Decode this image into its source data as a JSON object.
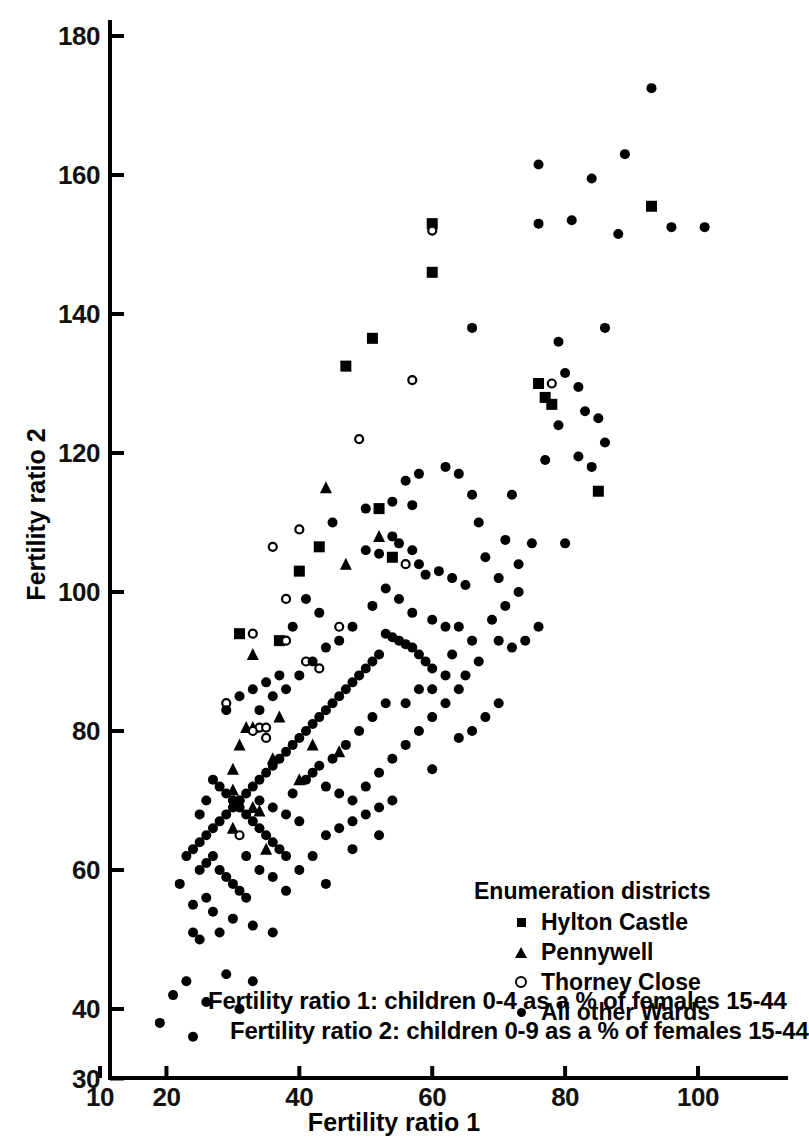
{
  "chart_data": {
    "type": "scatter",
    "title": "",
    "xlabel": "Fertility ratio 1",
    "ylabel": "Fertility ratio 2",
    "xlim": [
      10,
      108
    ],
    "ylim": [
      30,
      182
    ],
    "xticks": [
      10,
      20,
      40,
      60,
      80,
      100
    ],
    "yticks": [
      30,
      40,
      60,
      80,
      100,
      120,
      140,
      160,
      180
    ],
    "xtick_labels": [
      "10",
      "20",
      "40",
      "60",
      "80",
      "100"
    ],
    "ytick_labels": [
      "30",
      "40",
      "60",
      "80",
      "100",
      "120",
      "140",
      "160",
      "180"
    ],
    "grid": false,
    "legend_position": "lower-right",
    "legend_title": "Enumeration districts",
    "series": [
      {
        "name": "Hylton Castle",
        "marker": "filled-square",
        "points": [
          [
            47,
            132.5
          ],
          [
            60,
            153
          ],
          [
            60,
            146
          ],
          [
            51,
            136.5
          ],
          [
            43,
            106.5
          ],
          [
            40,
            103
          ],
          [
            52,
            112
          ],
          [
            37,
            93
          ],
          [
            76,
            130
          ],
          [
            77,
            128
          ],
          [
            85,
            114.5
          ],
          [
            93,
            155.5
          ],
          [
            78,
            127
          ],
          [
            54,
            105
          ],
          [
            31,
            94
          ]
        ]
      },
      {
        "name": "Pennywell",
        "marker": "filled-triangle",
        "points": [
          [
            44,
            115
          ],
          [
            32,
            80.5
          ],
          [
            31,
            78
          ],
          [
            30,
            74.5
          ],
          [
            30,
            71.5
          ],
          [
            33,
            80.5
          ],
          [
            52,
            108
          ],
          [
            47,
            104
          ],
          [
            33,
            91
          ],
          [
            37,
            82
          ],
          [
            36,
            76
          ],
          [
            40,
            73
          ],
          [
            42,
            78
          ],
          [
            46,
            77
          ],
          [
            33,
            69
          ],
          [
            34,
            68.5
          ],
          [
            30,
            66
          ],
          [
            35,
            63
          ]
        ]
      },
      {
        "name": "Thorney Close",
        "marker": "open-circle",
        "points": [
          [
            60,
            152
          ],
          [
            49,
            122
          ],
          [
            57,
            130.5
          ],
          [
            78,
            130
          ],
          [
            40,
            109
          ],
          [
            36,
            106.5
          ],
          [
            38,
            99
          ],
          [
            33,
            94
          ],
          [
            29,
            84
          ],
          [
            34,
            80.5
          ],
          [
            35,
            80.5
          ],
          [
            33,
            80
          ],
          [
            35,
            79
          ],
          [
            38,
            93
          ],
          [
            31,
            70
          ],
          [
            41,
            90
          ],
          [
            56,
            104
          ],
          [
            31,
            65
          ],
          [
            43,
            89
          ],
          [
            46,
            95
          ]
        ]
      },
      {
        "name": "All other Wards",
        "marker": "filled-circle",
        "points": [
          [
            93,
            172.5
          ],
          [
            89,
            163
          ],
          [
            76,
            161.5
          ],
          [
            84,
            159.5
          ],
          [
            81,
            153.5
          ],
          [
            101,
            152.5
          ],
          [
            96,
            152.5
          ],
          [
            88,
            151.5
          ],
          [
            76,
            153
          ],
          [
            86,
            138
          ],
          [
            66,
            138
          ],
          [
            79,
            136
          ],
          [
            80,
            131.5
          ],
          [
            82,
            129.5
          ],
          [
            83,
            126
          ],
          [
            85,
            125
          ],
          [
            86,
            121.5
          ],
          [
            82,
            119.5
          ],
          [
            72,
            114
          ],
          [
            66,
            114
          ],
          [
            54,
            113
          ],
          [
            57,
            112.5
          ],
          [
            67,
            110
          ],
          [
            71,
            107.5
          ],
          [
            73,
            104
          ],
          [
            54,
            108
          ],
          [
            55,
            107
          ],
          [
            57,
            106
          ],
          [
            50,
            106
          ],
          [
            52,
            105.5
          ],
          [
            58,
            104
          ],
          [
            61,
            103
          ],
          [
            59,
            102.5
          ],
          [
            63,
            102
          ],
          [
            65,
            101
          ],
          [
            68,
            105
          ],
          [
            70,
            102
          ],
          [
            53,
            100.5
          ],
          [
            55,
            99
          ],
          [
            51,
            98
          ],
          [
            57,
            97
          ],
          [
            60,
            96
          ],
          [
            62,
            95
          ],
          [
            64,
            95
          ],
          [
            66,
            93
          ],
          [
            70,
            93
          ],
          [
            72,
            92
          ],
          [
            53,
            94
          ],
          [
            54,
            93.5
          ],
          [
            55,
            93
          ],
          [
            56,
            92.5
          ],
          [
            57,
            92
          ],
          [
            58,
            91
          ],
          [
            59,
            90
          ],
          [
            60,
            89
          ],
          [
            52,
            91
          ],
          [
            51,
            90
          ],
          [
            50,
            89
          ],
          [
            49,
            88
          ],
          [
            48,
            87
          ],
          [
            47,
            86
          ],
          [
            46,
            85
          ],
          [
            45,
            84
          ],
          [
            44,
            83
          ],
          [
            43,
            82
          ],
          [
            42,
            81
          ],
          [
            41,
            80
          ],
          [
            40,
            79
          ],
          [
            39,
            78
          ],
          [
            38,
            77
          ],
          [
            37,
            76
          ],
          [
            36,
            75
          ],
          [
            35,
            74
          ],
          [
            34,
            73
          ],
          [
            33,
            72
          ],
          [
            32,
            71
          ],
          [
            31,
            70
          ],
          [
            30,
            69
          ],
          [
            29,
            68
          ],
          [
            28,
            67
          ],
          [
            27,
            66
          ],
          [
            26,
            65
          ],
          [
            25,
            64
          ],
          [
            24,
            63
          ],
          [
            28,
            72
          ],
          [
            29,
            71
          ],
          [
            30,
            70
          ],
          [
            31,
            69
          ],
          [
            32,
            68
          ],
          [
            33,
            67
          ],
          [
            34,
            66
          ],
          [
            35,
            65
          ],
          [
            36,
            64
          ],
          [
            37,
            63
          ],
          [
            38,
            62
          ],
          [
            27,
            62
          ],
          [
            26,
            61
          ],
          [
            25,
            60
          ],
          [
            28,
            60
          ],
          [
            29,
            59
          ],
          [
            30,
            58
          ],
          [
            31,
            57
          ],
          [
            32,
            56
          ],
          [
            26,
            56
          ],
          [
            24,
            55
          ],
          [
            27,
            54
          ],
          [
            30,
            53
          ],
          [
            33,
            52
          ],
          [
            36,
            51
          ],
          [
            24,
            51
          ],
          [
            25,
            50
          ],
          [
            28,
            51
          ],
          [
            23,
            44
          ],
          [
            26,
            41
          ],
          [
            21,
            42
          ],
          [
            19,
            38
          ],
          [
            24,
            36
          ],
          [
            31,
            40
          ],
          [
            33,
            44
          ],
          [
            29,
            45
          ],
          [
            42,
            74
          ],
          [
            44,
            72
          ],
          [
            46,
            71
          ],
          [
            48,
            70
          ],
          [
            50,
            72
          ],
          [
            52,
            74
          ],
          [
            54,
            76
          ],
          [
            56,
            78
          ],
          [
            58,
            80
          ],
          [
            60,
            82
          ],
          [
            62,
            84
          ],
          [
            64,
            86
          ],
          [
            47,
            78
          ],
          [
            49,
            80
          ],
          [
            51,
            82
          ],
          [
            53,
            84
          ],
          [
            45,
            76
          ],
          [
            43,
            75
          ],
          [
            41,
            73
          ],
          [
            39,
            71
          ],
          [
            60,
            74.5
          ],
          [
            63,
            91
          ],
          [
            65,
            88
          ],
          [
            67,
            90
          ],
          [
            69,
            96
          ],
          [
            71,
            98
          ],
          [
            73,
            100
          ],
          [
            75,
            107
          ],
          [
            77,
            119
          ],
          [
            79,
            124
          ],
          [
            62,
            118
          ],
          [
            64,
            117
          ],
          [
            56,
            116
          ],
          [
            58,
            117
          ],
          [
            50,
            112
          ],
          [
            45,
            110
          ],
          [
            41,
            99
          ],
          [
            43,
            97
          ],
          [
            39,
            95
          ],
          [
            37,
            88
          ],
          [
            35,
            87
          ],
          [
            33,
            86
          ],
          [
            31,
            85
          ],
          [
            29,
            83
          ],
          [
            42,
            90
          ],
          [
            44,
            92
          ],
          [
            46,
            93
          ],
          [
            48,
            95
          ],
          [
            34,
            83
          ],
          [
            36,
            85
          ],
          [
            38,
            86
          ],
          [
            40,
            88
          ],
          [
            26,
            70
          ],
          [
            27,
            73
          ],
          [
            25,
            68
          ],
          [
            23,
            62
          ],
          [
            22,
            58
          ],
          [
            44,
            65
          ],
          [
            46,
            66
          ],
          [
            48,
            67
          ],
          [
            50,
            68
          ],
          [
            52,
            69
          ],
          [
            54,
            70
          ],
          [
            38,
            68
          ],
          [
            40,
            67
          ],
          [
            36,
            69
          ],
          [
            34,
            70
          ],
          [
            32,
            62
          ],
          [
            34,
            60
          ],
          [
            36,
            59
          ],
          [
            38,
            57
          ],
          [
            40,
            60
          ],
          [
            42,
            62
          ],
          [
            44,
            58
          ],
          [
            48,
            63
          ],
          [
            52,
            65
          ],
          [
            58,
            86
          ],
          [
            56,
            84
          ],
          [
            60,
            86
          ],
          [
            62,
            88
          ],
          [
            66,
            80
          ],
          [
            64,
            79
          ],
          [
            68,
            82
          ],
          [
            70,
            84
          ],
          [
            74,
            93
          ],
          [
            76,
            95
          ],
          [
            80,
            107
          ],
          [
            84,
            118
          ]
        ]
      }
    ],
    "footnotes": [
      "Fertility ratio 1: children 0-4 as a % of females 15-44",
      "Fertility ratio 2: children 0-9 as a % of females 15-44"
    ]
  },
  "axes": {
    "x_label": "Fertility ratio 1",
    "y_label": "Fertility ratio 2",
    "x_tick_labels": [
      "10",
      "20",
      "40",
      "60",
      "80",
      "100"
    ],
    "y_tick_labels": [
      "180",
      "160",
      "140",
      "120",
      "100",
      "80",
      "60",
      "40",
      "30"
    ]
  },
  "legend": {
    "title": "Enumeration districts",
    "items": [
      {
        "label": "Hylton Castle",
        "marker": "filled-square"
      },
      {
        "label": "Pennywell",
        "marker": "filled-triangle"
      },
      {
        "label": "Thorney Close",
        "marker": "open-circle"
      },
      {
        "label": "All other Wards",
        "marker": "filled-circle"
      }
    ]
  },
  "footnotes": {
    "line1": "Fertility ratio 1: children 0-4 as a % of females 15-44",
    "line2": "Fertility ratio 2: children 0-9 as a % of females 15-44"
  },
  "colors": {
    "ink": "#000000",
    "background": "#ffffff"
  }
}
